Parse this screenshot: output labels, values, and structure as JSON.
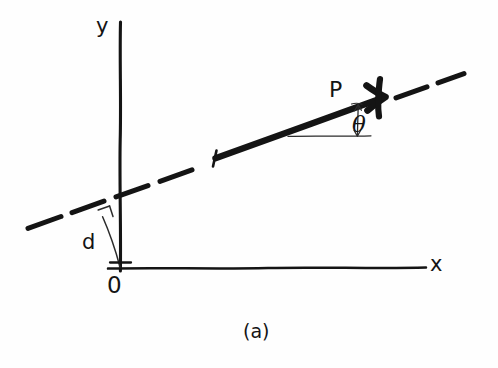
{
  "figure": {
    "caption": "(a)",
    "background_color": "#fefefe",
    "ink_color": "#141414",
    "style": "hand-drawn line diagram"
  },
  "axes": {
    "y_label": "y",
    "x_label": "x",
    "origin_label": "0"
  },
  "labels": {
    "point_label": "P",
    "angle_label": "θ",
    "distance_label": "d"
  },
  "geometry": {
    "type": "line-in-plane",
    "description": "A straight line of infinite extent (dashed) crossing the y-axis, with a bold direction vector P drawn along it; the angle theta is measured from the horizontal, and d is the perpendicular distance from the origin to the line.",
    "y_axis": {
      "x1": 120,
      "y1": 22,
      "x2": 120,
      "y2": 271
    },
    "x_axis": {
      "x1": 108,
      "y1": 268,
      "x2": 426,
      "y2": 268
    },
    "origin": {
      "x": 120,
      "y": 268
    },
    "dashed_line": {
      "x1": 28,
      "y1": 228,
      "x2": 464,
      "y2": 74
    },
    "vector_P": {
      "x1": 214,
      "y1": 159,
      "x2": 383,
      "y2": 92
    },
    "perpendicular_foot": {
      "x": 102,
      "y": 216
    },
    "angle_vertex": {
      "x": 358,
      "y": 104
    },
    "angle_reference_line": {
      "x1": 290,
      "y1": 136,
      "x2": 372,
      "y2": 136
    }
  }
}
